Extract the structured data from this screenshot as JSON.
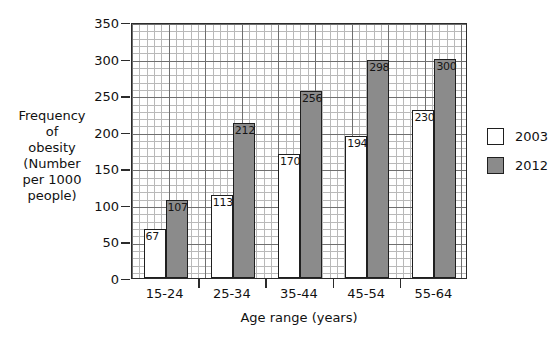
{
  "chart_data": {
    "type": "bar",
    "title": "",
    "categories": [
      "15-24",
      "25-34",
      "35-44",
      "45-54",
      "55-64"
    ],
    "series": [
      {
        "name": "2003",
        "values": [
          67,
          113,
          170,
          194,
          230
        ],
        "color": "#ffffff"
      },
      {
        "name": "2012",
        "values": [
          107,
          212,
          256,
          298,
          300
        ],
        "color": "#8b8b8b"
      }
    ],
    "xlabel": "Age range (years)",
    "ylabel": "Frequency of obesity (Number per 1000 people)",
    "ylim": [
      0,
      350
    ],
    "ytick_labels": [
      "0",
      "50",
      "100",
      "150",
      "200",
      "250",
      "300",
      "350"
    ],
    "ytick_values": [
      0,
      50,
      100,
      150,
      200,
      250,
      300,
      350
    ],
    "minor_grid_step": 10,
    "grid": true,
    "legend_position": "right",
    "legend": [
      "2003",
      "2012"
    ],
    "data_labels": true
  },
  "axis": {
    "ylabel_lines": [
      "Frequency",
      "of",
      "obesity",
      "(Number",
      "per 1000",
      "people)"
    ],
    "xlabel": "Age range (years)"
  }
}
